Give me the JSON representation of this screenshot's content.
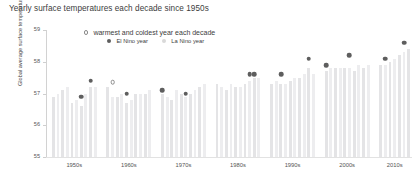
{
  "chart_data": {
    "type": "bar",
    "title": "Yearly surface temperatures each decade since 1950s",
    "xlabel": "",
    "ylabel": "Global average surface temperature (oF)",
    "ylim": [
      55,
      59
    ],
    "ytick_labels": [
      "59",
      "58",
      "57",
      "56",
      "55"
    ],
    "ytick_values": [
      59,
      58,
      57,
      56,
      55
    ],
    "grid": false,
    "legend_position": "top-center",
    "categories": [
      "1950s",
      "1960s",
      "1970s",
      "1980s",
      "1990s",
      "2000s",
      "2010s"
    ],
    "legend": [
      {
        "key": "extreme",
        "label": "warmest and coldest year each decade",
        "marker": "open-circle"
      },
      {
        "key": "el-nino",
        "label": "El Nino year",
        "marker": "filled-circle"
      },
      {
        "key": "la-nino",
        "label": "La Nino year",
        "marker": "faint-circle"
      }
    ],
    "groups": [
      {
        "decade": "1950s",
        "values": [
          56.9,
          57.0,
          57.1,
          57.2,
          56.7,
          56.8,
          56.6,
          57.0,
          57.2,
          57.2
        ],
        "markers": [
          {
            "index": 6,
            "value": 56.9,
            "type": "el-nino"
          },
          {
            "index": 8,
            "value": 57.4,
            "type": "el-nino"
          }
        ]
      },
      {
        "decade": "1960s",
        "values": [
          57.2,
          56.9,
          56.9,
          57.0,
          56.7,
          56.8,
          57.0,
          57.0,
          57.0,
          57.1
        ],
        "markers": [
          {
            "index": 1,
            "value": 57.35,
            "type": "extreme"
          },
          {
            "index": 4,
            "value": 57.0,
            "type": "el-nino"
          }
        ]
      },
      {
        "decade": "1970s",
        "values": [
          57.0,
          56.9,
          56.8,
          57.1,
          57.0,
          56.9,
          57.0,
          57.1,
          57.2,
          57.3
        ],
        "markers": [
          {
            "index": 0,
            "value": 57.1,
            "type": "el-nino"
          },
          {
            "index": 5,
            "value": 57.0,
            "type": "el-nino"
          }
        ]
      },
      {
        "decade": "1980s",
        "values": [
          57.3,
          57.2,
          57.1,
          57.3,
          57.2,
          57.2,
          57.3,
          57.4,
          57.5,
          57.5
        ],
        "markers": [
          {
            "index": 7,
            "value": 57.6,
            "type": "el-nino"
          },
          {
            "index": 8,
            "value": 57.6,
            "type": "el-nino"
          }
        ]
      },
      {
        "decade": "1990s",
        "values": [
          57.3,
          57.4,
          57.3,
          57.3,
          57.4,
          57.5,
          57.5,
          57.6,
          57.8,
          57.6
        ],
        "markers": [
          {
            "index": 2,
            "value": 57.6,
            "type": "el-nino"
          },
          {
            "index": 8,
            "value": 58.1,
            "type": "el-nino"
          }
        ]
      },
      {
        "decade": "2000s",
        "values": [
          57.7,
          57.8,
          57.8,
          57.8,
          57.8,
          57.8,
          57.7,
          57.9,
          57.8,
          57.9
        ],
        "markers": [
          {
            "index": 0,
            "value": 57.9,
            "type": "el-nino"
          },
          {
            "index": 5,
            "value": 58.2,
            "type": "el-nino"
          }
        ]
      },
      {
        "decade": "2010s",
        "values": [
          57.9,
          57.9,
          58.0,
          58.1,
          58.2,
          58.3,
          58.4
        ],
        "markers": [
          {
            "index": 1,
            "value": 58.1,
            "type": "el-nino"
          },
          {
            "index": 5,
            "value": 58.6,
            "type": "el-nino"
          }
        ]
      }
    ],
    "colors": {
      "bar": "#e4e4e6",
      "bar_alt": "#ededef",
      "marker_filled": "#5e5e5e",
      "marker_open_border": "#8c8c8c",
      "text": "#3d3d3d",
      "axis": "#d2d2d2"
    }
  }
}
